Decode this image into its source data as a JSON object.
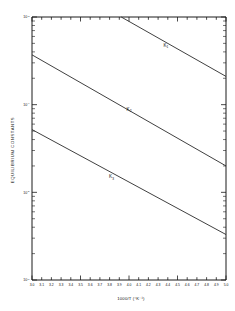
{
  "figure": {
    "background_color": "#ffffff",
    "ink_color": "#1a1a1a"
  },
  "chart_data": {
    "type": "line",
    "title": "",
    "subtitle": "",
    "xlabel": "1000/T (°K⁻¹)",
    "ylabel": "EQUILIBRIUM CONSTANTS",
    "xscale": "linear",
    "yscale": "log",
    "xlim": [
      3.0,
      5.0
    ],
    "ylim": [
      1e-06,
      0.001
    ],
    "grid": false,
    "legend_position": "inline-annotation",
    "xticks": [
      3.0,
      3.1,
      3.2,
      3.3,
      3.4,
      3.5,
      3.6,
      3.7,
      3.8,
      3.9,
      4.0,
      4.1,
      4.2,
      4.3,
      4.4,
      4.5,
      4.6,
      4.7,
      4.8,
      4.9,
      5.0
    ],
    "xticklabels": [
      "3.0",
      "3.1",
      "3.2",
      "3.3",
      "3.4",
      "3.5",
      "3.6",
      "3.7",
      "3.8",
      "3.9",
      "4.0",
      "4.1",
      "4.2",
      "4.3",
      "4.4",
      "4.5",
      "4.6",
      "4.7",
      "4.8",
      "4.9",
      "5.0"
    ],
    "yticks": [
      1e-06,
      1e-05,
      0.0001,
      0.001
    ],
    "yticklabels": [
      "10⁻⁶",
      "10⁻⁵",
      "10⁻⁴",
      "10⁻³"
    ],
    "ytick_mantissa": "10",
    "ytick_exponents": [
      "-6",
      "-5",
      "-4",
      "-3"
    ],
    "series": [
      {
        "name": "K₁",
        "label_base": "K",
        "label_sub": "1",
        "x": [
          3.92,
          5.0
        ],
        "y": [
          0.001,
          0.00021
        ],
        "label_x": 4.38,
        "label_y": 0.00046
      },
      {
        "name": "K₂",
        "label_base": "K",
        "label_sub": "2",
        "x": [
          3.0,
          5.0
        ],
        "y": [
          0.00037,
          2e-05
        ],
        "label_x": 4.0,
        "label_y": 8.5e-05
      },
      {
        "name": "K₃",
        "label_base": "K",
        "label_sub": "3",
        "x": [
          3.0,
          5.0
        ],
        "y": [
          5.2e-05,
          3.3e-06
        ],
        "label_x": 3.82,
        "label_y": 1.45e-05
      }
    ]
  }
}
